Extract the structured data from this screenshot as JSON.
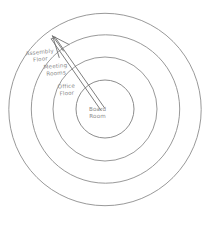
{
  "diagram": {
    "type": "concentric-rings",
    "background_color": "#ffffff",
    "line_color": "#8d8d8d",
    "text_color": "#8a8a8a",
    "center": {
      "x": 105,
      "y": 109
    },
    "rings": [
      {
        "index": 0,
        "name": "assembly-floor",
        "label_line_1": "Assembly",
        "label_line_2": "Floor",
        "radius": 96,
        "position": "outermost"
      },
      {
        "index": 1,
        "name": "meeting-rooms",
        "label_line_1": "Meeting",
        "label_line_2": "Rooms",
        "radius": 74,
        "position": "outer-middle"
      },
      {
        "index": 2,
        "name": "office-floor",
        "label_line_1": "Office",
        "label_line_2": "Floor",
        "radius": 52,
        "position": "inner-middle"
      },
      {
        "index": 3,
        "name": "board-room",
        "label_line_1": "Board",
        "label_line_2": "Room",
        "radius": 29,
        "position": "center"
      }
    ],
    "arrow": {
      "name": "outward-arrow",
      "description": "double-line arrow drawn from the centre circle outward to the upper-left",
      "tail": {
        "x": 103,
        "y": 107
      },
      "head": {
        "x": 52,
        "y": 35
      },
      "direction": "center-to-outer"
    }
  }
}
